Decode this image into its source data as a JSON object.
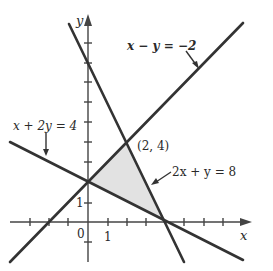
{
  "figure": {
    "type": "linear-inequalities-feasible-region",
    "axes": {
      "x_label": "x",
      "y_label": "y",
      "origin_label": "0",
      "x_tick_label": "1",
      "y_tick_label": "1"
    },
    "lines": [
      {
        "id": "line1",
        "equation": "x − y = −2"
      },
      {
        "id": "line2",
        "equation": "x + 2y = 4"
      },
      {
        "id": "line3",
        "equation": "2x + y = 8"
      }
    ],
    "point_label": "(2, 4)",
    "shaded_region": {
      "vertices": [
        [
          0,
          2
        ],
        [
          2,
          4
        ],
        [
          4,
          0
        ]
      ],
      "color": "#e2e2e2"
    },
    "colors": {
      "line": "#333333",
      "axis": "#444444",
      "text": "#2a2a2a"
    }
  }
}
